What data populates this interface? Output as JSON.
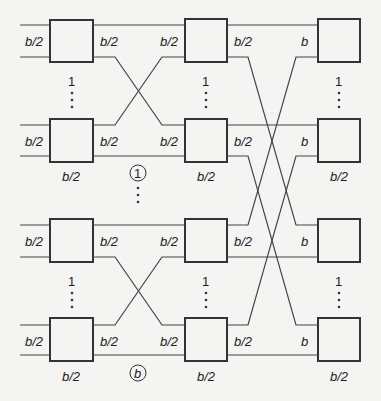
{
  "diagram": {
    "type": "multistage switch network (butterfly)",
    "columns": [
      {
        "id": "stage-1",
        "input_label": "b/2",
        "output_label": "b/2",
        "box_label": "b/2"
      },
      {
        "id": "stage-2",
        "input_label": "b/2",
        "output_label": "b/2",
        "box_label": "b/2"
      },
      {
        "id": "stage-3",
        "input_label": "b",
        "box_label": "b/2"
      }
    ],
    "labels": {
      "half": "b/2",
      "full": "b",
      "one": "1",
      "group_index_first": "1",
      "group_index_last": "b"
    }
  }
}
